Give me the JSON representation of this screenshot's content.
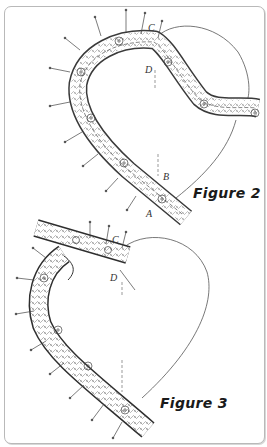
{
  "figures": [
    {
      "label": "Figure 2",
      "points": {
        "a": "A",
        "b": "B",
        "c": "C",
        "d": "D"
      }
    },
    {
      "label": "Figure 3",
      "points": {
        "c": "C",
        "d": "D"
      }
    }
  ],
  "colors": {
    "line": "#444444",
    "frame_border": "#b9b9b9",
    "background": "#ffffff"
  }
}
